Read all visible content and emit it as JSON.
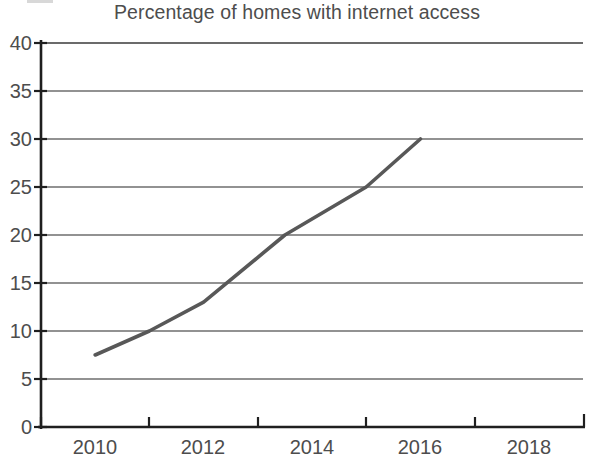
{
  "chart_data": {
    "type": "line",
    "title": "Percentage of homes with internet access",
    "xlabel": "",
    "ylabel": "",
    "xlim": [
      2009,
      2019
    ],
    "ylim": [
      0,
      40
    ],
    "ytick_values": [
      0,
      5,
      10,
      15,
      20,
      25,
      30,
      35,
      40
    ],
    "ytick_labels": [
      "0",
      "5",
      "10",
      "15",
      "20",
      "25",
      "30",
      "35",
      "40"
    ],
    "xtick_values": [
      2009,
      2011,
      2013,
      2015,
      2017,
      2019
    ],
    "xtick_labels": [
      "",
      "",
      "",
      "",
      "",
      ""
    ],
    "x_category_labels": [
      "2010",
      "2012",
      "2014",
      "2016",
      "2018"
    ],
    "x_category_values": [
      2010,
      2012,
      2014,
      2016,
      2018
    ],
    "grid": true,
    "grid_axis": "y",
    "legend": false,
    "series": [
      {
        "name": "Homes with internet access",
        "color": "#585858",
        "x": [
          2010,
          2011,
          2012,
          2013.5,
          2015,
          2016
        ],
        "values": [
          7.5,
          10,
          13,
          20,
          25,
          30
        ]
      }
    ]
  },
  "colors": {
    "line": "#585858",
    "axis": "#2b2b2b",
    "grid": "#6e6e6e",
    "text": "#4d4d4d",
    "background": "#ffffff"
  },
  "axes": {
    "y_axis_name": "y-axis",
    "x_axis_name": "x-axis"
  }
}
